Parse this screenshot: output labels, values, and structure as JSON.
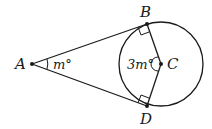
{
  "diagram": {
    "points": {
      "A": {
        "label": "A",
        "x": 32,
        "y": 64
      },
      "B": {
        "label": "B",
        "x": 147,
        "y": 24
      },
      "C": {
        "label": "C",
        "x": 161,
        "y": 64
      },
      "D": {
        "label": "D",
        "x": 147,
        "y": 106
      }
    },
    "circle": {
      "center": "C",
      "radius": 42
    },
    "angles": {
      "A": {
        "label": "m°"
      },
      "C": {
        "label": "3m°"
      }
    },
    "stroke_color": "#1a1a1a"
  }
}
